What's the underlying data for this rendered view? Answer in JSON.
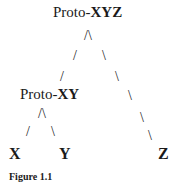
{
  "diagram": {
    "type": "tree",
    "nodes": {
      "root": {
        "prefix": "Proto-",
        "suffix": "XYZ"
      },
      "mid": {
        "prefix": "Proto-",
        "suffix": "XY"
      },
      "leaf_x": "X",
      "leaf_y": "Y",
      "leaf_z": "Z"
    },
    "edges": {
      "root_branch": "/\\",
      "mid_branch": "/\\",
      "slash": "/",
      "backslash": "\\"
    },
    "caption": "Figure 1.1"
  }
}
